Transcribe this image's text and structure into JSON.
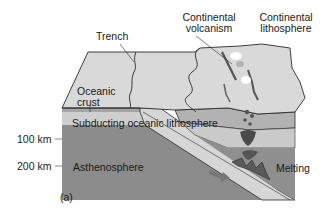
{
  "figure": {
    "panel_label": "(a)",
    "labels": {
      "trench": "Trench",
      "continental_volcanism_line1": "Continental",
      "continental_volcanism_line2": "volcanism",
      "continental_lithosphere_line1": "Continental",
      "continental_lithosphere_line2": "lithosphere",
      "oceanic_crust_line1": "Oceanic",
      "oceanic_crust_line2": "crust",
      "subducting_plate": "Subducting oceanic lithosphere",
      "asthenosphere": "Asthenosphere",
      "melting": "Melting"
    },
    "depth_scale": [
      {
        "label": "100 km"
      },
      {
        "label": "200 km"
      }
    ],
    "colors": {
      "surface": "#d9d9d9",
      "oceanic_crust_band": "#a9a9a9",
      "subducting_plate": "#d2d2d2",
      "asthenosphere": "#8c8c8c",
      "continental_crust_band": "#b0b0b0",
      "continental_lower": "#c8c8c8",
      "outline": "#2a2a2a",
      "text": "#1a1a1a"
    }
  }
}
